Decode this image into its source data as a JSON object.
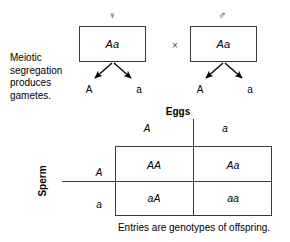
{
  "diagram": {
    "title_note": "Meiotic segregation produces gametes.",
    "cross_symbol": "×",
    "parents": [
      {
        "sex_icon": "female-symbol",
        "sex_glyph": "♀",
        "genotype": "Aa",
        "gametes": [
          "A",
          "a"
        ]
      },
      {
        "sex_icon": "male-symbol",
        "sex_glyph": "♂",
        "genotype": "Aa",
        "gametes": [
          "A",
          "a"
        ]
      }
    ]
  },
  "punnett": {
    "column_axis_title": "Eggs",
    "row_axis_title": "Sperm",
    "column_alleles": [
      "A",
      "a"
    ],
    "row_alleles": [
      "A",
      "a"
    ],
    "cells": [
      [
        "AA",
        "Aa"
      ],
      [
        "aA",
        "aa"
      ]
    ],
    "caption": "Entries are genotypes of offspring."
  },
  "colors": {
    "ink": "#000000",
    "rule": "#3a3a3a",
    "background": "#ffffff"
  }
}
